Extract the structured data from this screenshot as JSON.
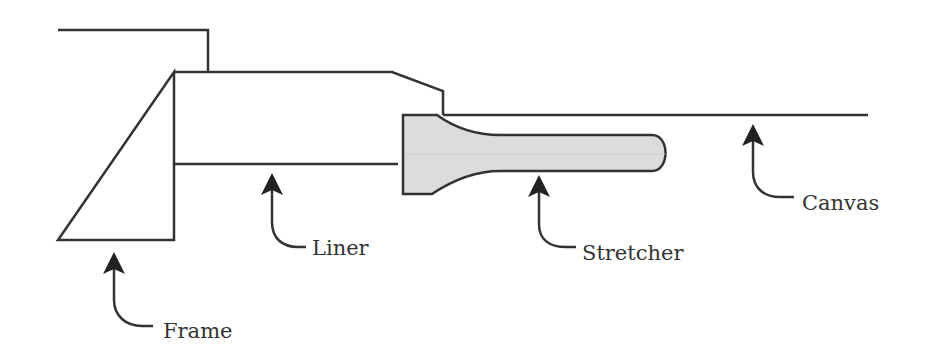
{
  "diagram": {
    "colors": {
      "stroke": "#333333",
      "stretcher_fill": "#dcdcdc",
      "background": "#ffffff"
    },
    "parts": [
      {
        "id": "frame",
        "label": "Frame"
      },
      {
        "id": "liner",
        "label": "Liner"
      },
      {
        "id": "stretcher",
        "label": "Stretcher"
      },
      {
        "id": "canvas",
        "label": "Canvas"
      }
    ],
    "labels": {
      "frame": "Frame",
      "liner": "Liner",
      "stretcher": "Stretcher",
      "canvas": "Canvas"
    }
  }
}
